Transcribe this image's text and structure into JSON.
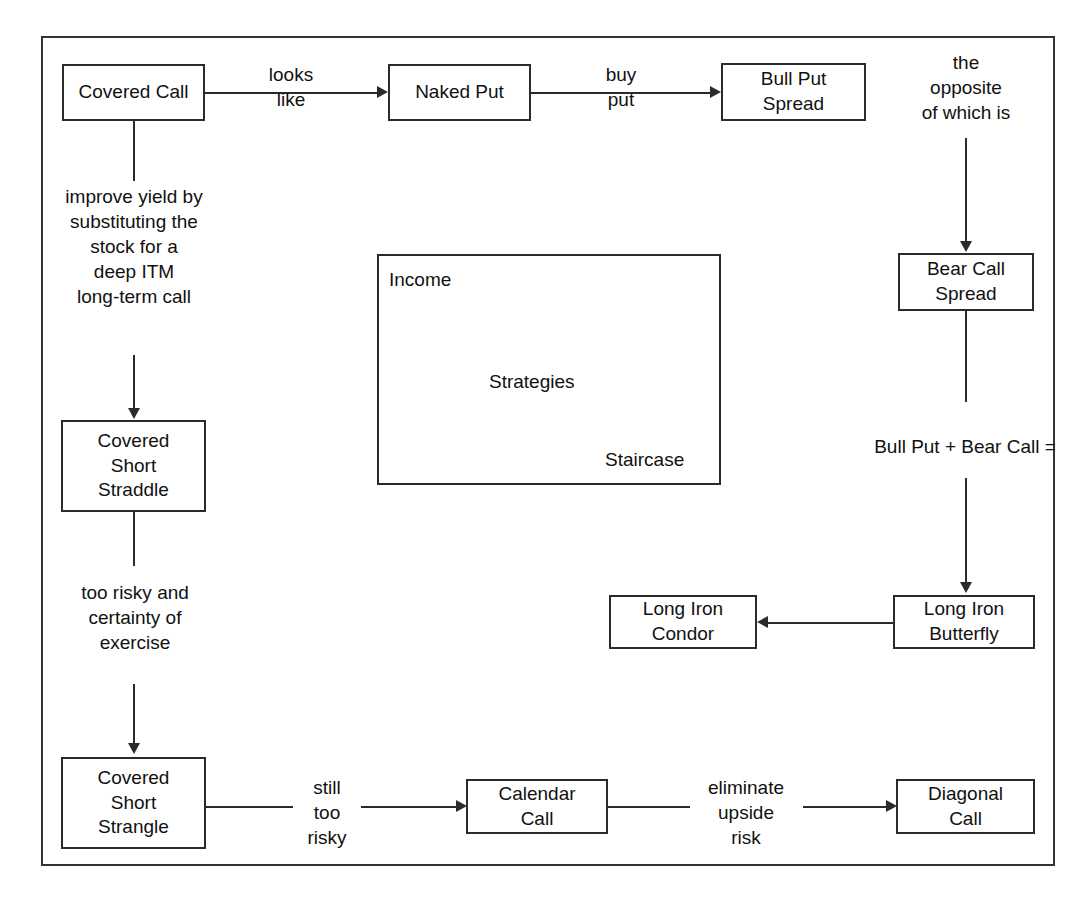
{
  "figure": {
    "title_sliver": "",
    "panel": {
      "top_left_label": "Income",
      "center_label": "Strategies",
      "bottom_right_label": "Staircase"
    },
    "nodes": {
      "covered_call": "Covered Call",
      "naked_put": "Naked Put",
      "bull_put_spread": "Bull Put\nSpread",
      "bear_call_spread": "Bear Call\nSpread",
      "covered_short_straddle": "Covered\nShort\nStraddle",
      "covered_short_strangle": "Covered\nShort\nStrangle",
      "long_iron_butterfly": "Long Iron\nButterfly",
      "long_iron_condor": "Long Iron\nCondor",
      "calendar_call": "Calendar\nCall",
      "diagonal_call": "Diagonal\nCall"
    },
    "edge_labels": {
      "looks_like": "looks\nlike",
      "buy_put": "buy\nput",
      "opposite_of_which_is": "the\nopposite\nof which is",
      "improve_yield": "improve yield by\nsubstituting the\nstock for a\ndeep ITM\nlong-term call",
      "too_risky": "too risky and\ncertainty of\nexercise",
      "bull_put_plus_bear_call": "Bull Put + Bear Call =",
      "still_too_risky": "still\ntoo\nrisky",
      "eliminate_upside_risk": "eliminate\nupside\nrisk"
    },
    "colors": {
      "stroke": "#2b2b2b",
      "frame": "#333333",
      "text": "#111111",
      "background": "#ffffff"
    }
  }
}
